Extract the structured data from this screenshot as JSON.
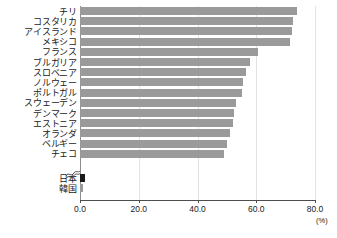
{
  "chart_data": {
    "type": "bar",
    "orientation": "horizontal",
    "title": "",
    "subtitle": "",
    "xlabel": "(%)",
    "ylabel": "",
    "xlim": [
      0,
      80
    ],
    "xticks": [
      "0.0",
      "20.0",
      "40.0",
      "60.0",
      "80.0"
    ],
    "xtick_values": [
      0,
      20,
      40,
      60,
      80
    ],
    "grid": true,
    "grid_axis": "x",
    "legend": null,
    "axis_break": true,
    "axis_break_note": "break between チェコ and 日本",
    "categories": [
      "チリ",
      "コスタリカ",
      "アイスランド",
      "メキシコ",
      "フランス",
      "ブルガリア",
      "スロベニア",
      "ノルウェー",
      "ポルトガル",
      "スウェーデン",
      "デンマーク",
      "エストニア",
      "オランダ",
      "ベルギー",
      "チェコ",
      "日本",
      "韓国"
    ],
    "values": [
      74.0,
      72.5,
      72.0,
      71.5,
      60.5,
      58.0,
      56.5,
      55.5,
      55.0,
      53.0,
      52.5,
      52.0,
      51.0,
      50.0,
      49.0,
      1.6,
      1.0
    ],
    "bar_colors": [
      "#9a9a9a",
      "#9a9a9a",
      "#9a9a9a",
      "#9a9a9a",
      "#9a9a9a",
      "#9a9a9a",
      "#9a9a9a",
      "#9a9a9a",
      "#9a9a9a",
      "#9a9a9a",
      "#9a9a9a",
      "#9a9a9a",
      "#9a9a9a",
      "#9a9a9a",
      "#9a9a9a",
      "#1a1a1a",
      "#9a9a9a"
    ],
    "colors": {
      "bar_default": "#9a9a9a",
      "bar_highlight": "#1a1a1a",
      "gridline": "#e3e3e3",
      "axis": "#4d4d4d",
      "text": "#1a1a1a",
      "background": "#ffffff"
    }
  }
}
